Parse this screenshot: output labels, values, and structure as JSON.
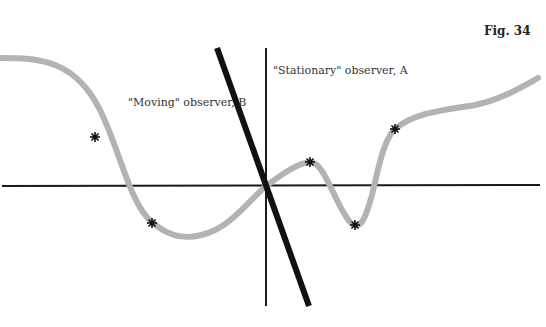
{
  "figure": {
    "label": "Fig. 34",
    "labels": {
      "stationary": "\"Stationary\" observer, A",
      "moving": "\"Moving\" observer, B"
    },
    "colors": {
      "curve": "#b3b3b3",
      "axes": "#1a1a1a",
      "moving_line": "#111111",
      "markers": "#111111",
      "text": "#333333"
    },
    "curve_path": "M 0 58 C 40 58, 75 60, 100 110 C 120 150, 130 205, 152 222 C 170 238, 190 242, 215 230 C 235 220, 250 200, 266 186 C 280 176, 295 164, 310 162 C 325 162, 335 205, 350 222 C 360 232, 365 220, 372 195 C 380 160, 385 138, 395 129 C 415 112, 445 110, 475 105 C 500 100, 520 88, 538 78",
    "markers": [
      {
        "x": 95,
        "y": 137
      },
      {
        "x": 152,
        "y": 223
      },
      {
        "x": 310,
        "y": 162
      },
      {
        "x": 355,
        "y": 225
      },
      {
        "x": 395,
        "y": 129
      }
    ],
    "axes": {
      "horizontal": {
        "x1": 2,
        "y1": 186,
        "x2": 540,
        "y2": 185
      },
      "vertical": {
        "x1": 266,
        "y1": 48,
        "x2": 266,
        "y2": 306
      }
    },
    "moving_line": {
      "x1": 217,
      "y1": 48,
      "x2": 309,
      "y2": 306
    }
  }
}
